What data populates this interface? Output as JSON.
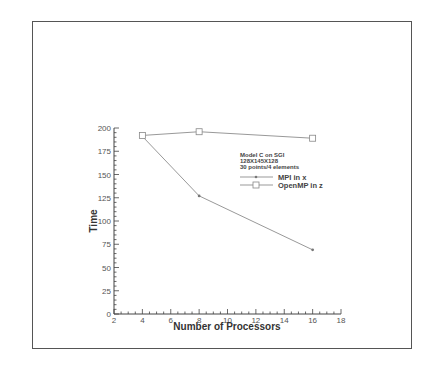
{
  "chart_data": {
    "type": "line",
    "title": "",
    "xlabel": "Number of Processors",
    "ylabel": "Time",
    "xlim": [
      2,
      18
    ],
    "ylim": [
      0,
      200
    ],
    "x_ticks": [
      "2",
      "4",
      "6",
      "8",
      "10",
      "12",
      "14",
      "16",
      "18"
    ],
    "y_ticks": [
      "0",
      "25",
      "50",
      "75",
      "100",
      "125",
      "150",
      "175",
      "200"
    ],
    "grid": false,
    "legend_position": "upper right (inside plot)",
    "annotation": [
      "Model C on SGI",
      "128X145X128",
      "30 points/4 elements"
    ],
    "x": [
      4,
      8,
      16
    ],
    "series": [
      {
        "name": "MPI in x",
        "marker": "small-dot",
        "values": [
          191,
          127,
          69
        ]
      },
      {
        "name": "OpenMP in z",
        "marker": "square",
        "values": [
          192,
          196,
          189
        ]
      }
    ]
  },
  "colors": {
    "line": "#999999",
    "axis": "#444444",
    "frame": "#555555"
  }
}
